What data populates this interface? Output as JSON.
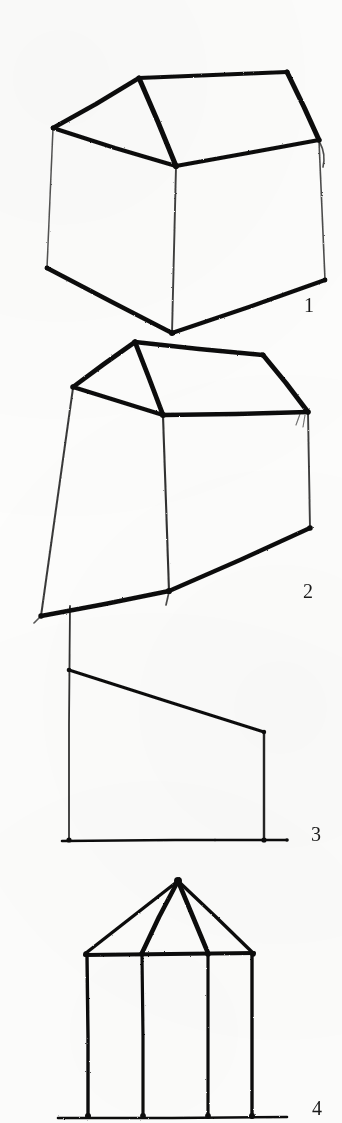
{
  "page": {
    "medium": "scanned hand-drawn pen sketches on paper",
    "background_color": "#fdfdfc",
    "ink_color": "#111111",
    "width": 342,
    "height": 1123
  },
  "figures": [
    {
      "number": "1",
      "name": "gabled-house-perspective-wide",
      "description": "Three-quarter perspective line drawing of a simple gabled shed; two roof planes, near vertical corner post, splayed ground edges",
      "label_position": {
        "x": 304,
        "y": 295
      }
    },
    {
      "number": "2",
      "name": "gabled-house-perspective-tall",
      "description": "Three-quarter perspective line drawing of the same gabled shed seen from a lower viewpoint, walls battered outward",
      "label_position": {
        "x": 303,
        "y": 581
      }
    },
    {
      "number": "3",
      "name": "mono-pitch-elevation",
      "description": "Flat elevation of a mono-pitch lean-to: tall left post, sloping roof line, short right post, ground line",
      "label_position": {
        "x": 311,
        "y": 824
      }
    },
    {
      "number": "4",
      "name": "hipped-pavilion-elevation",
      "description": "Frontal elevation of a hipped-roof pavilion: apex with four hip rafters, eave beam and four vertical posts on a ground line",
      "label_position": {
        "x": 312,
        "y": 1098
      }
    }
  ],
  "chart_data": {
    "type": "line",
    "xlabel": "",
    "ylabel": "",
    "figures": [
      {
        "id": 1,
        "caption": "1",
        "strokes": [
          {
            "name": "ridge-line",
            "points": [
              [
                139,
                78
              ],
              [
                287,
                72
              ]
            ]
          },
          {
            "name": "right-gable-rake",
            "points": [
              [
                287,
                72
              ],
              [
                319,
                140
              ]
            ]
          },
          {
            "name": "left-gable-rake",
            "points": [
              [
                139,
                78
              ],
              [
                53,
                128
              ]
            ]
          },
          {
            "name": "near-hip-rafter",
            "points": [
              [
                139,
                78
              ],
              [
                176,
                166
              ]
            ]
          },
          {
            "name": "left-eave",
            "points": [
              [
                53,
                128
              ],
              [
                176,
                166
              ]
            ]
          },
          {
            "name": "right-eave",
            "points": [
              [
                176,
                166
              ],
              [
                319,
                140
              ]
            ]
          },
          {
            "name": "left-wall-post",
            "points": [
              [
                53,
                128
              ],
              [
                47,
                268
              ]
            ]
          },
          {
            "name": "near-corner-post",
            "points": [
              [
                176,
                166
              ],
              [
                172,
                333
              ]
            ]
          },
          {
            "name": "right-wall-post",
            "points": [
              [
                319,
                140
              ],
              [
                325,
                280
              ]
            ]
          },
          {
            "name": "left-ground-edge",
            "points": [
              [
                47,
                268
              ],
              [
                172,
                333
              ]
            ]
          },
          {
            "name": "right-ground-edge",
            "points": [
              [
                172,
                333
              ],
              [
                325,
                280
              ]
            ]
          },
          {
            "name": "right-post-tick",
            "points": [
              [
                320,
                142
              ],
              [
                324,
                166
              ]
            ]
          }
        ]
      },
      {
        "id": 2,
        "caption": "2",
        "strokes": [
          {
            "name": "ridge-line",
            "points": [
              [
                135,
                342
              ],
              [
                263,
                355
              ]
            ]
          },
          {
            "name": "right-gable-rake",
            "points": [
              [
                263,
                355
              ],
              [
                308,
                412
              ]
            ]
          },
          {
            "name": "left-gable-rake",
            "points": [
              [
                135,
                342
              ],
              [
                73,
                387
              ]
            ]
          },
          {
            "name": "near-hip-rafter",
            "points": [
              [
                135,
                342
              ],
              [
                163,
                415
              ]
            ]
          },
          {
            "name": "left-eave",
            "points": [
              [
                73,
                387
              ],
              [
                163,
                415
              ]
            ]
          },
          {
            "name": "right-eave",
            "points": [
              [
                163,
                415
              ],
              [
                308,
                412
              ]
            ]
          },
          {
            "name": "left-wall-post",
            "points": [
              [
                73,
                387
              ],
              [
                41,
                616
              ]
            ]
          },
          {
            "name": "near-corner-post",
            "points": [
              [
                163,
                415
              ],
              [
                169,
                591
              ]
            ]
          },
          {
            "name": "right-wall-post",
            "points": [
              [
                308,
                412
              ],
              [
                310,
                528
              ]
            ]
          },
          {
            "name": "left-ground-edge",
            "points": [
              [
                41,
                616
              ],
              [
                169,
                591
              ]
            ]
          },
          {
            "name": "right-ground-edge",
            "points": [
              [
                169,
                591
              ],
              [
                310,
                528
              ]
            ]
          }
        ]
      },
      {
        "id": 3,
        "caption": "3",
        "strokes": [
          {
            "name": "left-post",
            "points": [
              [
                70,
                606
              ],
              [
                69,
                841
              ]
            ]
          },
          {
            "name": "roof-slope",
            "points": [
              [
                69,
                670
              ],
              [
                264,
                732
              ]
            ]
          },
          {
            "name": "right-post",
            "points": [
              [
                264,
                732
              ],
              [
                264,
                841
              ]
            ]
          },
          {
            "name": "ground-line",
            "points": [
              [
                62,
                841
              ],
              [
                287,
                840
              ]
            ]
          }
        ]
      },
      {
        "id": 4,
        "caption": "4",
        "strokes": [
          {
            "name": "hip-rafter-far-left",
            "points": [
              [
                178,
                881
              ],
              [
                86,
                953
              ]
            ]
          },
          {
            "name": "hip-rafter-mid-left",
            "points": [
              [
                178,
                881
              ],
              [
                142,
                953
              ]
            ]
          },
          {
            "name": "hip-rafter-mid-right",
            "points": [
              [
                178,
                881
              ],
              [
                208,
                953
              ]
            ]
          },
          {
            "name": "hip-rafter-far-right",
            "points": [
              [
                178,
                881
              ],
              [
                253,
                953
              ]
            ]
          },
          {
            "name": "eave-beam",
            "points": [
              [
                85,
                955
              ],
              [
                254,
                953
              ]
            ]
          },
          {
            "name": "post-1",
            "points": [
              [
                87,
                955
              ],
              [
                88,
                1117
              ]
            ]
          },
          {
            "name": "post-2",
            "points": [
              [
                142,
                955
              ],
              [
                143,
                1117
              ]
            ]
          },
          {
            "name": "post-3",
            "points": [
              [
                208,
                954
              ],
              [
                208,
                1117
              ]
            ]
          },
          {
            "name": "post-4",
            "points": [
              [
                252,
                953
              ],
              [
                252,
                1117
              ]
            ]
          },
          {
            "name": "ground-line",
            "points": [
              [
                58,
                1118
              ],
              [
                287,
                1117
              ]
            ]
          }
        ]
      }
    ]
  }
}
